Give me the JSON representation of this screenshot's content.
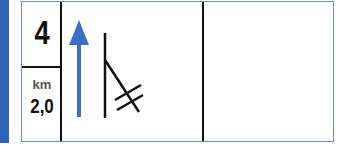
{
  "sign": {
    "exit_number": "4",
    "distance_unit": "km",
    "distance_value": "2,0",
    "colors": {
      "accent_bar": "#2f62b6",
      "arrow": "#3a6fc4",
      "border": "#6f8fcf",
      "lines": "#111111"
    },
    "diagram": {
      "arrow_direction": "up",
      "symbol": "road-branch-with-railway-crossing"
    }
  }
}
